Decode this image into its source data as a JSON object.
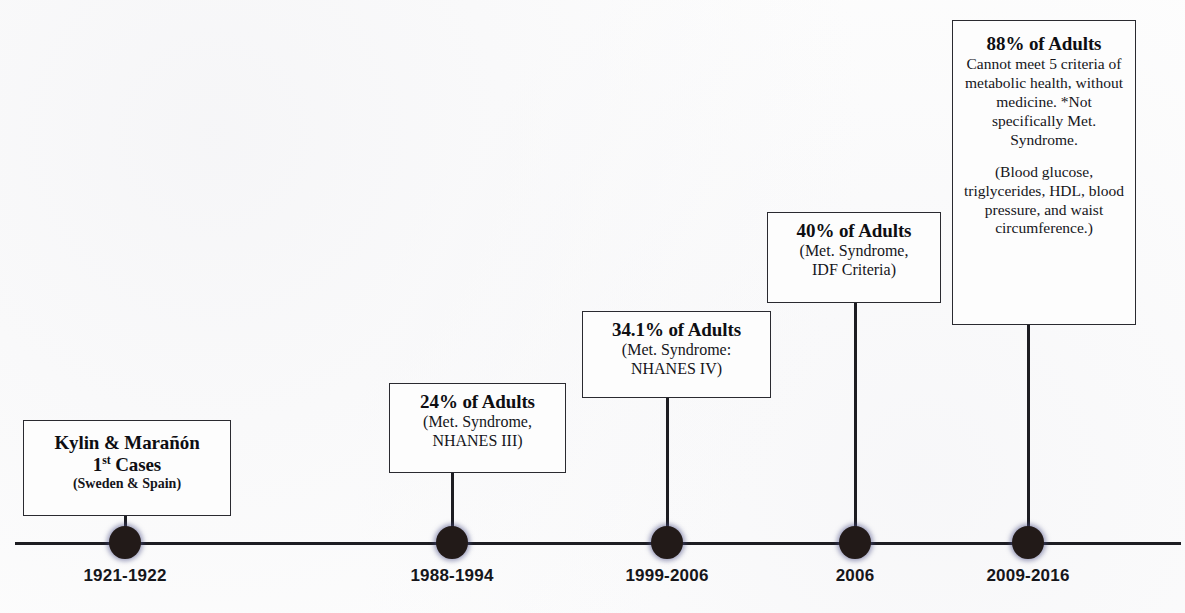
{
  "figure": {
    "background_color": "#fdfdfd",
    "axis_color": "#1d1d22",
    "node_color": "#221a18",
    "node_halo_color": "#464882"
  },
  "timeline": {
    "axis": {
      "start_x": 15,
      "end_x": 1181,
      "y": 543
    },
    "events": [
      {
        "id": "event-1",
        "year_label": "1921-1922",
        "node_x": 125,
        "headline": "Kylin & Marañón",
        "headline_line2_pre": "1",
        "headline_line2_sup": "st",
        "headline_line2_post": " Cases",
        "sub": "(Sweden & Spain)"
      },
      {
        "id": "event-2",
        "year_label": "1988-1994",
        "node_x": 452,
        "headline": "24% of Adults",
        "sub_line1": "(Met. Syndrome,",
        "sub_line2": "NHANES III)"
      },
      {
        "id": "event-3",
        "year_label": "1999-2006",
        "node_x": 667,
        "headline": "34.1% of Adults",
        "sub_line1": "(Met. Syndrome:",
        "sub_line2": "NHANES IV)"
      },
      {
        "id": "event-4",
        "year_label": "2006",
        "node_x": 855,
        "headline": "40% of Adults",
        "sub_line1": "(Met. Syndrome,",
        "sub_line2": "IDF Criteria)"
      },
      {
        "id": "event-5",
        "year_label": "2009-2016",
        "node_x": 1028,
        "headline": "88% of Adults",
        "body": "Cannot meet 5 criteria of metabolic health, without medicine. *Not specifically Met. Syndrome.",
        "body_2": "(Blood glucose, triglycerides, HDL, blood pressure, and waist circumference.)"
      }
    ]
  }
}
